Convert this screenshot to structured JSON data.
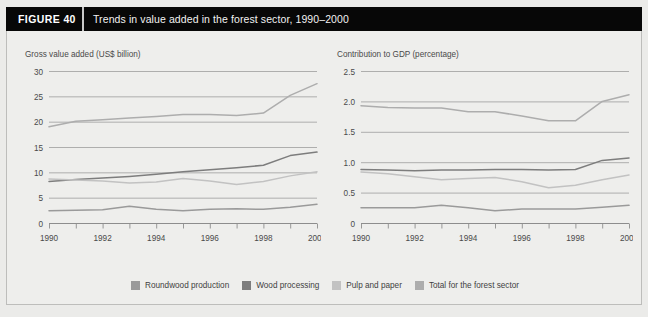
{
  "figure": {
    "number_label": "FIGURE  40",
    "caption": "Trends in value added in the forest sector, 1990–2000"
  },
  "legend": {
    "items": [
      {
        "label": "Roundwood production",
        "color": "#9a9a9a",
        "key": "roundwood"
      },
      {
        "label": "Wood processing",
        "color": "#7d7d7d",
        "key": "wood_processing"
      },
      {
        "label": "Pulp and paper",
        "color": "#c2c2c2",
        "key": "pulp_and_paper"
      },
      {
        "label": "Total for the forest sector",
        "color": "#adadad",
        "key": "total"
      }
    ]
  },
  "chart_data": [
    {
      "id": "gross-value-added",
      "type": "line",
      "title": "Gross value added (US$ billion)",
      "xlabel": "",
      "ylabel": "Gross value added (US$ billion)",
      "x": [
        1990,
        1991,
        1992,
        1993,
        1994,
        1995,
        1996,
        1997,
        1998,
        1999,
        2000
      ],
      "xtick_labels": [
        "1990",
        "1992",
        "1994",
        "1996",
        "1998",
        "2000"
      ],
      "xtick_values": [
        1990,
        1992,
        1994,
        1996,
        1998,
        2000
      ],
      "xlim": [
        1990,
        2000
      ],
      "ylim": [
        0,
        30
      ],
      "ytick_labels": [
        "0",
        "5",
        "10",
        "15",
        "20",
        "25",
        "30"
      ],
      "ytick_values": [
        0,
        5,
        10,
        15,
        20,
        25,
        30
      ],
      "grid": true,
      "legend_position": "below-shared",
      "series": [
        {
          "name": "Total for the forest sector",
          "color": "#adadad",
          "values": [
            19.0,
            20.1,
            20.4,
            20.7,
            21.0,
            21.4,
            21.4,
            21.2,
            21.7,
            25.2,
            27.5
          ]
        },
        {
          "name": "Wood processing",
          "color": "#7d7d7d",
          "values": [
            8.2,
            8.6,
            8.9,
            9.2,
            9.6,
            10.1,
            10.5,
            10.9,
            11.4,
            13.3,
            14.0
          ]
        },
        {
          "name": "Pulp and paper",
          "color": "#c2c2c2",
          "values": [
            8.7,
            8.5,
            8.3,
            7.9,
            8.1,
            8.8,
            8.3,
            7.6,
            8.2,
            9.3,
            10.1
          ]
        },
        {
          "name": "Roundwood production",
          "color": "#9a9a9a",
          "values": [
            2.4,
            2.5,
            2.6,
            3.3,
            2.7,
            2.4,
            2.7,
            2.8,
            2.7,
            3.1,
            3.7
          ]
        }
      ]
    },
    {
      "id": "contribution-to-gdp",
      "type": "line",
      "title": "Contribution to GDP (percentage)",
      "xlabel": "",
      "ylabel": "Contribution to GDP (percentage)",
      "x": [
        1990,
        1991,
        1992,
        1993,
        1994,
        1995,
        1996,
        1997,
        1998,
        1999,
        2000
      ],
      "xtick_labels": [
        "1990",
        "1992",
        "1994",
        "1996",
        "1998",
        "2000"
      ],
      "xtick_values": [
        1990,
        1992,
        1994,
        1996,
        1998,
        2000
      ],
      "xlim": [
        1990,
        2000
      ],
      "ylim": [
        0,
        2.5
      ],
      "ytick_labels": [
        "0",
        "0.5",
        "1.0",
        "1.5",
        "2.0",
        "2.5"
      ],
      "ytick_values": [
        0,
        0.5,
        1.0,
        1.5,
        2.0,
        2.5
      ],
      "grid": true,
      "legend_position": "below-shared",
      "series": [
        {
          "name": "Total for the forest sector",
          "color": "#adadad",
          "values": [
            1.93,
            1.9,
            1.89,
            1.89,
            1.83,
            1.83,
            1.76,
            1.68,
            1.68,
            2.0,
            2.11
          ]
        },
        {
          "name": "Wood processing",
          "color": "#7d7d7d",
          "values": [
            0.88,
            0.87,
            0.86,
            0.87,
            0.87,
            0.88,
            0.88,
            0.87,
            0.88,
            1.03,
            1.07
          ]
        },
        {
          "name": "Pulp and paper",
          "color": "#c2c2c2",
          "values": [
            0.84,
            0.81,
            0.76,
            0.71,
            0.73,
            0.75,
            0.68,
            0.58,
            0.62,
            0.71,
            0.79
          ]
        },
        {
          "name": "Roundwood production",
          "color": "#9a9a9a",
          "values": [
            0.25,
            0.25,
            0.25,
            0.29,
            0.25,
            0.2,
            0.23,
            0.23,
            0.23,
            0.26,
            0.29
          ]
        }
      ]
    }
  ]
}
